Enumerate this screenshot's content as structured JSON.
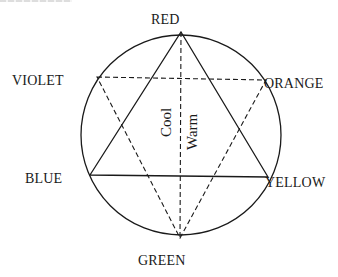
{
  "diagram": {
    "type": "color-wheel-hexagram",
    "colors": {
      "line": "#1a1a1a",
      "background": "#ffffff"
    },
    "circle": {
      "cx": 181,
      "cy": 135,
      "r": 100
    },
    "vertices": {
      "red": {
        "label": "RED",
        "x": 181,
        "y": 32
      },
      "orange": {
        "label": "ORANGE",
        "x": 266,
        "y": 80
      },
      "yellow": {
        "label": "YELLOW",
        "x": 268,
        "y": 177
      },
      "green": {
        "label": "GREEN",
        "x": 180,
        "y": 238
      },
      "blue": {
        "label": "BLUE",
        "x": 90,
        "y": 175
      },
      "violet": {
        "label": "VIOLET",
        "x": 97,
        "y": 77
      }
    },
    "solid_triangle": [
      "red",
      "yellow",
      "blue"
    ],
    "dashed_triangle": [
      "violet",
      "orange",
      "green"
    ],
    "dashed_divider": [
      "red",
      "green"
    ],
    "side_labels": {
      "cool": "Cool",
      "warm": "Warm"
    }
  }
}
